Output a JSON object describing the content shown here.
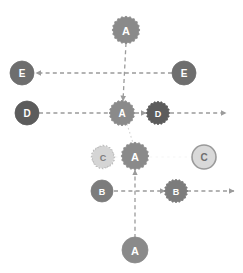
{
  "diagram": {
    "canvas": {
      "width": 243,
      "height": 273,
      "background": "#ffffff"
    },
    "palette": {
      "node_a": "#8a8a8a",
      "node_b": "#7c7c7c",
      "node_c_ghost_fill": "#d5d5d5",
      "node_c_ghost_stroke": "#bdbdbd",
      "node_c_solid_fill": "#d9d9d9",
      "node_c_solid_stroke": "#9a9a9a",
      "node_d": "#5c5c5c",
      "node_e": "#6e6e6e",
      "edge": "#9b9b9b",
      "edge_faint": "#cccccc",
      "label_text": "#ffffff",
      "label_text_dark": "#555555"
    },
    "nodes": [
      {
        "id": "a-top",
        "label": "A",
        "x": 126,
        "y": 30,
        "r": 13,
        "fill": "#8a8a8a",
        "stroke": "#8a8a8a",
        "text": "#ffffff",
        "shape": "scallop",
        "dashed": false
      },
      {
        "id": "e-left",
        "label": "E",
        "x": 22,
        "y": 73,
        "r": 12,
        "fill": "#6e6e6e",
        "stroke": "#6e6e6e",
        "text": "#ffffff",
        "shape": "circle",
        "dashed": false
      },
      {
        "id": "e-right",
        "label": "E",
        "x": 184,
        "y": 73,
        "r": 12,
        "fill": "#6e6e6e",
        "stroke": "#6e6e6e",
        "text": "#ffffff",
        "shape": "circle",
        "dashed": false
      },
      {
        "id": "d-left",
        "label": "D",
        "x": 27,
        "y": 113,
        "r": 12,
        "fill": "#5c5c5c",
        "stroke": "#5c5c5c",
        "text": "#ffffff",
        "shape": "circle",
        "dashed": false
      },
      {
        "id": "a-center",
        "label": "A",
        "x": 122,
        "y": 113,
        "r": 12,
        "fill": "#8a8a8a",
        "stroke": "#8a8a8a",
        "text": "#ffffff",
        "shape": "scallop",
        "dashed": false
      },
      {
        "id": "d-right",
        "label": "D",
        "x": 158,
        "y": 113,
        "r": 11,
        "fill": "#5c5c5c",
        "stroke": "#5c5c5c",
        "text": "#ffffff",
        "shape": "scallop",
        "dashed": false
      },
      {
        "id": "c-ghost",
        "label": "C",
        "x": 103,
        "y": 157,
        "r": 11,
        "fill": "#d5d5d5",
        "stroke": "#bdbdbd",
        "text": "#7d7d7d",
        "shape": "scallop",
        "dashed": true
      },
      {
        "id": "a-mid",
        "label": "A",
        "x": 135,
        "y": 156,
        "r": 13,
        "fill": "#8a8a8a",
        "stroke": "#8a8a8a",
        "text": "#ffffff",
        "shape": "scallop",
        "dashed": false
      },
      {
        "id": "c-solid",
        "label": "C",
        "x": 204,
        "y": 157,
        "r": 12,
        "fill": "#d9d9d9",
        "stroke": "#9a9a9a",
        "text": "#6f6f6f",
        "shape": "circle",
        "dashed": false
      },
      {
        "id": "b-left",
        "label": "B",
        "x": 102,
        "y": 191,
        "r": 11,
        "fill": "#7c7c7c",
        "stroke": "#7c7c7c",
        "text": "#ffffff",
        "shape": "circle",
        "dashed": false
      },
      {
        "id": "b-right",
        "label": "B",
        "x": 176,
        "y": 191,
        "r": 11,
        "fill": "#7c7c7c",
        "stroke": "#7c7c7c",
        "text": "#ffffff",
        "shape": "scallop",
        "dashed": false
      },
      {
        "id": "a-bottom",
        "label": "A",
        "x": 135,
        "y": 250,
        "r": 13,
        "fill": "#8a8a8a",
        "stroke": "#8a8a8a",
        "text": "#ffffff",
        "shape": "circle",
        "dashed": false
      }
    ],
    "edges": [
      {
        "id": "edge-a-top-to-a-center",
        "from": "a-top",
        "to": "a-center",
        "x1": 126,
        "y1": 43,
        "x2": 123,
        "y2": 101,
        "arrow": true,
        "style": "dashed",
        "color": "#9b9b9b"
      },
      {
        "id": "edge-e-row-to-left",
        "from": "e-right",
        "to": "e-left",
        "x1": 172,
        "y1": 73,
        "x2": 36,
        "y2": 73,
        "arrow": true,
        "style": "dashed",
        "color": "#9b9b9b"
      },
      {
        "id": "edge-d-left-to-center",
        "from": "d-left",
        "to": "a-center",
        "x1": 39,
        "y1": 113,
        "x2": 109,
        "y2": 113,
        "arrow": false,
        "style": "dashed",
        "color": "#9b9b9b"
      },
      {
        "id": "edge-a-center-to-d-right",
        "from": "a-center",
        "to": "d-right",
        "x1": 135,
        "y1": 113,
        "x2": 146,
        "y2": 113,
        "arrow": true,
        "style": "dashed",
        "color": "#9b9b9b"
      },
      {
        "id": "edge-d-right-to-east",
        "from": "d-right",
        "to": "east",
        "x1": 170,
        "y1": 113,
        "x2": 226,
        "y2": 113,
        "arrow": true,
        "style": "dashed",
        "color": "#9b9b9b"
      },
      {
        "id": "edge-a-center-to-a-mid",
        "from": "a-center",
        "to": "a-mid",
        "x1": 127,
        "y1": 124,
        "x2": 133,
        "y2": 143,
        "arrow": false,
        "style": "dotted",
        "color": "#cccccc"
      },
      {
        "id": "edge-b-left-to-b-right",
        "from": "b-left",
        "to": "b-right",
        "x1": 114,
        "y1": 191,
        "x2": 165,
        "y2": 191,
        "arrow": true,
        "style": "dashed",
        "color": "#9b9b9b"
      },
      {
        "id": "edge-b-right-to-east",
        "from": "b-right",
        "to": "east",
        "x1": 187,
        "y1": 191,
        "x2": 234,
        "y2": 191,
        "arrow": true,
        "style": "dashed",
        "color": "#9b9b9b"
      },
      {
        "id": "edge-a-bottom-to-a-mid",
        "from": "a-bottom",
        "to": "a-mid",
        "x1": 135,
        "y1": 238,
        "x2": 135,
        "y2": 170,
        "arrow": true,
        "style": "dashed",
        "color": "#9b9b9b"
      },
      {
        "id": "edge-c-ghost-trace",
        "from": "c-ghost",
        "to": "c-solid",
        "x1": 115,
        "y1": 157,
        "x2": 191,
        "y2": 157,
        "arrow": false,
        "style": "faint",
        "color": "#ededed"
      }
    ],
    "legend_labels": {
      "a": "A",
      "b": "B",
      "c": "C",
      "d": "D",
      "e": "E"
    }
  },
  "chart_data": {
    "type": "diagram",
    "node_labels": [
      "A",
      "E",
      "E",
      "D",
      "A",
      "D",
      "C",
      "A",
      "C",
      "B",
      "B",
      "A"
    ],
    "node_positions": [
      [
        126,
        30
      ],
      [
        22,
        73
      ],
      [
        184,
        73
      ],
      [
        27,
        113
      ],
      [
        122,
        113
      ],
      [
        158,
        113
      ],
      [
        103,
        157
      ],
      [
        135,
        156
      ],
      [
        204,
        157
      ],
      [
        102,
        191
      ],
      [
        176,
        191
      ],
      [
        135,
        250
      ]
    ],
    "edge_count": 10,
    "xlabel": "",
    "ylabel": ""
  }
}
